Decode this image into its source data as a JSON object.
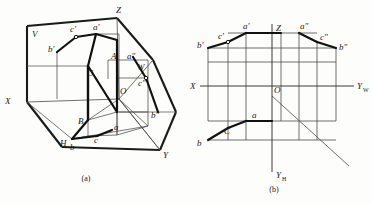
{
  "figure": {
    "panels": [
      {
        "id": "a",
        "caption": "(a)",
        "description": "Pictorial view of the three mutually perpendicular projection planes V, H, W with projections of points A, B, C",
        "axis_labels": [
          "X",
          "Y",
          "Z"
        ],
        "plane_labels": [
          "V",
          "H",
          "W"
        ],
        "origin_label": "O",
        "space_points": [
          "A",
          "B",
          "C"
        ],
        "front_projections": [
          "a'",
          "b'",
          "c'"
        ],
        "top_projections": [
          "a",
          "b",
          "c"
        ],
        "side_projections": [
          "a″",
          "b″",
          "c″"
        ]
      },
      {
        "id": "b",
        "caption": "(b)",
        "description": "Unfolded two-dimensional projection drawing with axes X, Y_W, Y_H, Z",
        "axis_labels": [
          "X",
          "Z"
        ],
        "y_axis_w": {
          "base": "Y",
          "sub": "W"
        },
        "y_axis_h": {
          "base": "Y",
          "sub": "H"
        },
        "origin_label": "O",
        "front_projections": [
          "a'",
          "b'",
          "c'"
        ],
        "top_projections": [
          "a",
          "b",
          "C"
        ],
        "side_projections": [
          "a″",
          "b″",
          "c″"
        ]
      }
    ],
    "colors": {
      "ink": "#1a1a1a",
      "thin_line": "#3c3c3c",
      "background": "#fdfdfc"
    }
  }
}
